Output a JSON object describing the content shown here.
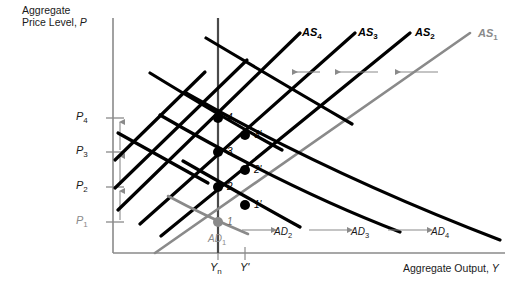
{
  "figure": {
    "type": "economics-ad-as-diagram",
    "y_axis_title_line1": "Aggregate",
    "y_axis_title_line2": "Price Level, P",
    "x_axis_title": "Aggregate Output, Y",
    "colors": {
      "curve_black": "#000000",
      "curve_gray": "#8a8a8a",
      "axis_gray": "#8a8a8a",
      "arrow_gray": "#8a8a8a",
      "text_black": "#1a1a1a"
    }
  },
  "y_ticks": [
    {
      "label": "P",
      "sub": "4",
      "value": 4,
      "y": 118,
      "gray": false
    },
    {
      "label": "P",
      "sub": "3",
      "value": 3,
      "y": 152,
      "gray": false
    },
    {
      "label": "P",
      "sub": "2",
      "value": 2,
      "y": 187,
      "gray": false
    },
    {
      "label": "P",
      "sub": "1",
      "value": 1,
      "y": 222,
      "gray": true
    }
  ],
  "x_ticks": [
    {
      "label": "Y",
      "sub": "n",
      "x": 218
    },
    {
      "label": "Y'",
      "sub": "",
      "x": 245
    }
  ],
  "as_curves": [
    {
      "name": "AS",
      "sub": "4",
      "gray": false
    },
    {
      "name": "AS",
      "sub": "3",
      "gray": false
    },
    {
      "name": "AS",
      "sub": "2",
      "gray": false
    },
    {
      "name": "AS",
      "sub": "1",
      "gray": true
    }
  ],
  "ad_curves": [
    {
      "name": "AD",
      "sub": "1",
      "gray": true
    },
    {
      "name": "AD",
      "sub": "2",
      "gray": false
    },
    {
      "name": "AD",
      "sub": "3",
      "gray": false
    },
    {
      "name": "AD",
      "sub": "4",
      "gray": false
    }
  ],
  "equilibrium_points": [
    {
      "label": "1",
      "x": 218,
      "y": 222,
      "gray": true
    },
    {
      "label": "1'",
      "x": 245,
      "y": 205,
      "gray": false
    },
    {
      "label": "2",
      "x": 218,
      "y": 187,
      "gray": false
    },
    {
      "label": "2'",
      "x": 245,
      "y": 170,
      "gray": false
    },
    {
      "label": "3",
      "x": 218,
      "y": 152,
      "gray": false
    },
    {
      "label": "3'",
      "x": 245,
      "y": 135,
      "gray": false
    },
    {
      "label": "4",
      "x": 218,
      "y": 118,
      "gray": false
    }
  ],
  "arrows": {
    "as_shift_direction": "left",
    "ad_shift_direction": "right",
    "price_level_direction": "up",
    "as_arrow_count": 3,
    "ad_arrow_count": 3,
    "price_arrow_count": 3
  }
}
